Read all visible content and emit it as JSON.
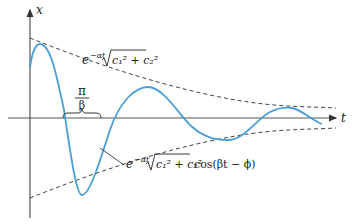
{
  "figure": {
    "axes": {
      "vertical_label": "x",
      "horizontal_label": "t"
    },
    "labels": {
      "upper_envelope": {
        "base": "e",
        "exponent": "−αt",
        "radicand": "c₁² + c₂²",
        "text": "e^(−αt) √(c₁² + c₂²)"
      },
      "curve": {
        "base": "e",
        "exponent": "−αt",
        "radicand": "c₁² + c₂²",
        "trailer": "cos(βt − ϕ)",
        "text": "e^(−αt) √(c₁² + c₂²) cos(βt − ϕ)"
      },
      "half_period": {
        "numerator": "π",
        "denominator": "β",
        "text": "π/β"
      }
    },
    "colors": {
      "curve": "#4a9fd4",
      "axes": "#333333",
      "envelope": "#444444",
      "text": "#222222"
    }
  }
}
